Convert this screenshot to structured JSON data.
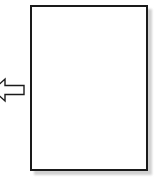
{
  "canvas": {
    "width": 162,
    "height": 189,
    "background_color": "#ffffff"
  },
  "diagram": {
    "title": "",
    "elements": [
      {
        "name": "page-rectangle",
        "type": "rectangle",
        "fill_color": "#ffffff",
        "stroke_color": "#1a1a1a",
        "stroke_width": 2.5,
        "x": 30,
        "y": 5,
        "width": 118,
        "height": 166,
        "label": "",
        "has_shadow": true,
        "shadow_color": "#c9c9c9",
        "shadow_offset_x": 4,
        "shadow_offset_y": 4
      },
      {
        "name": "left-arrow",
        "type": "arrow",
        "direction": "left",
        "fill_color": "#ffffff",
        "stroke_color": "#1a1a1a",
        "stroke_width": 1.3,
        "x": -8,
        "y": 78,
        "width": 34,
        "height": 24,
        "label": "",
        "clipped_at": "left-edge"
      }
    ]
  }
}
